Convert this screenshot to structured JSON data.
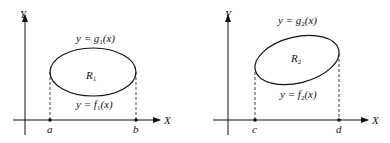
{
  "figures": [
    {
      "axes": {
        "x_label": "X",
        "y_label": "Y"
      },
      "region_label": "R",
      "region_sub": "1",
      "upper_curve": {
        "prefix": "y = g",
        "sub": "1",
        "suffix": "(x)"
      },
      "lower_curve": {
        "prefix": "y = f",
        "sub": "1",
        "suffix": "(x)"
      },
      "x_points": [
        "a",
        "b"
      ]
    },
    {
      "axes": {
        "x_label": "X",
        "y_label": "Y"
      },
      "region_label": "R",
      "region_sub": "2",
      "upper_curve": {
        "prefix": "y = g",
        "sub": "2",
        "suffix": "(x)"
      },
      "lower_curve": {
        "prefix": "y = f",
        "sub": "2",
        "suffix": "(x)"
      },
      "x_points": [
        "c",
        "d"
      ]
    }
  ]
}
